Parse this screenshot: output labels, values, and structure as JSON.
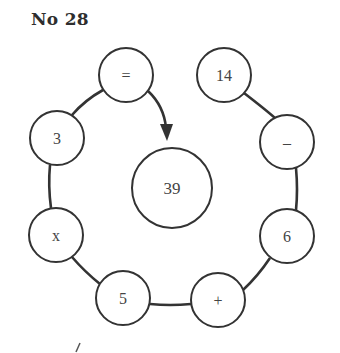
{
  "title": "No 28",
  "puzzle": {
    "center_value": "39",
    "chain": [
      {
        "label": "=",
        "cx": 126,
        "cy": 75
      },
      {
        "label": "14",
        "cx": 224,
        "cy": 75
      },
      {
        "label": "–",
        "cx": 287,
        "cy": 142
      },
      {
        "label": "6",
        "cx": 287,
        "cy": 236
      },
      {
        "label": "+",
        "cx": 218,
        "cy": 300
      },
      {
        "label": "5",
        "cx": 123,
        "cy": 298
      },
      {
        "label": "x",
        "cx": 56,
        "cy": 235
      },
      {
        "label": "3",
        "cx": 57,
        "cy": 138
      }
    ],
    "colors": {
      "stroke": "#333333",
      "text": "#444444",
      "background": "#ffffff"
    }
  }
}
